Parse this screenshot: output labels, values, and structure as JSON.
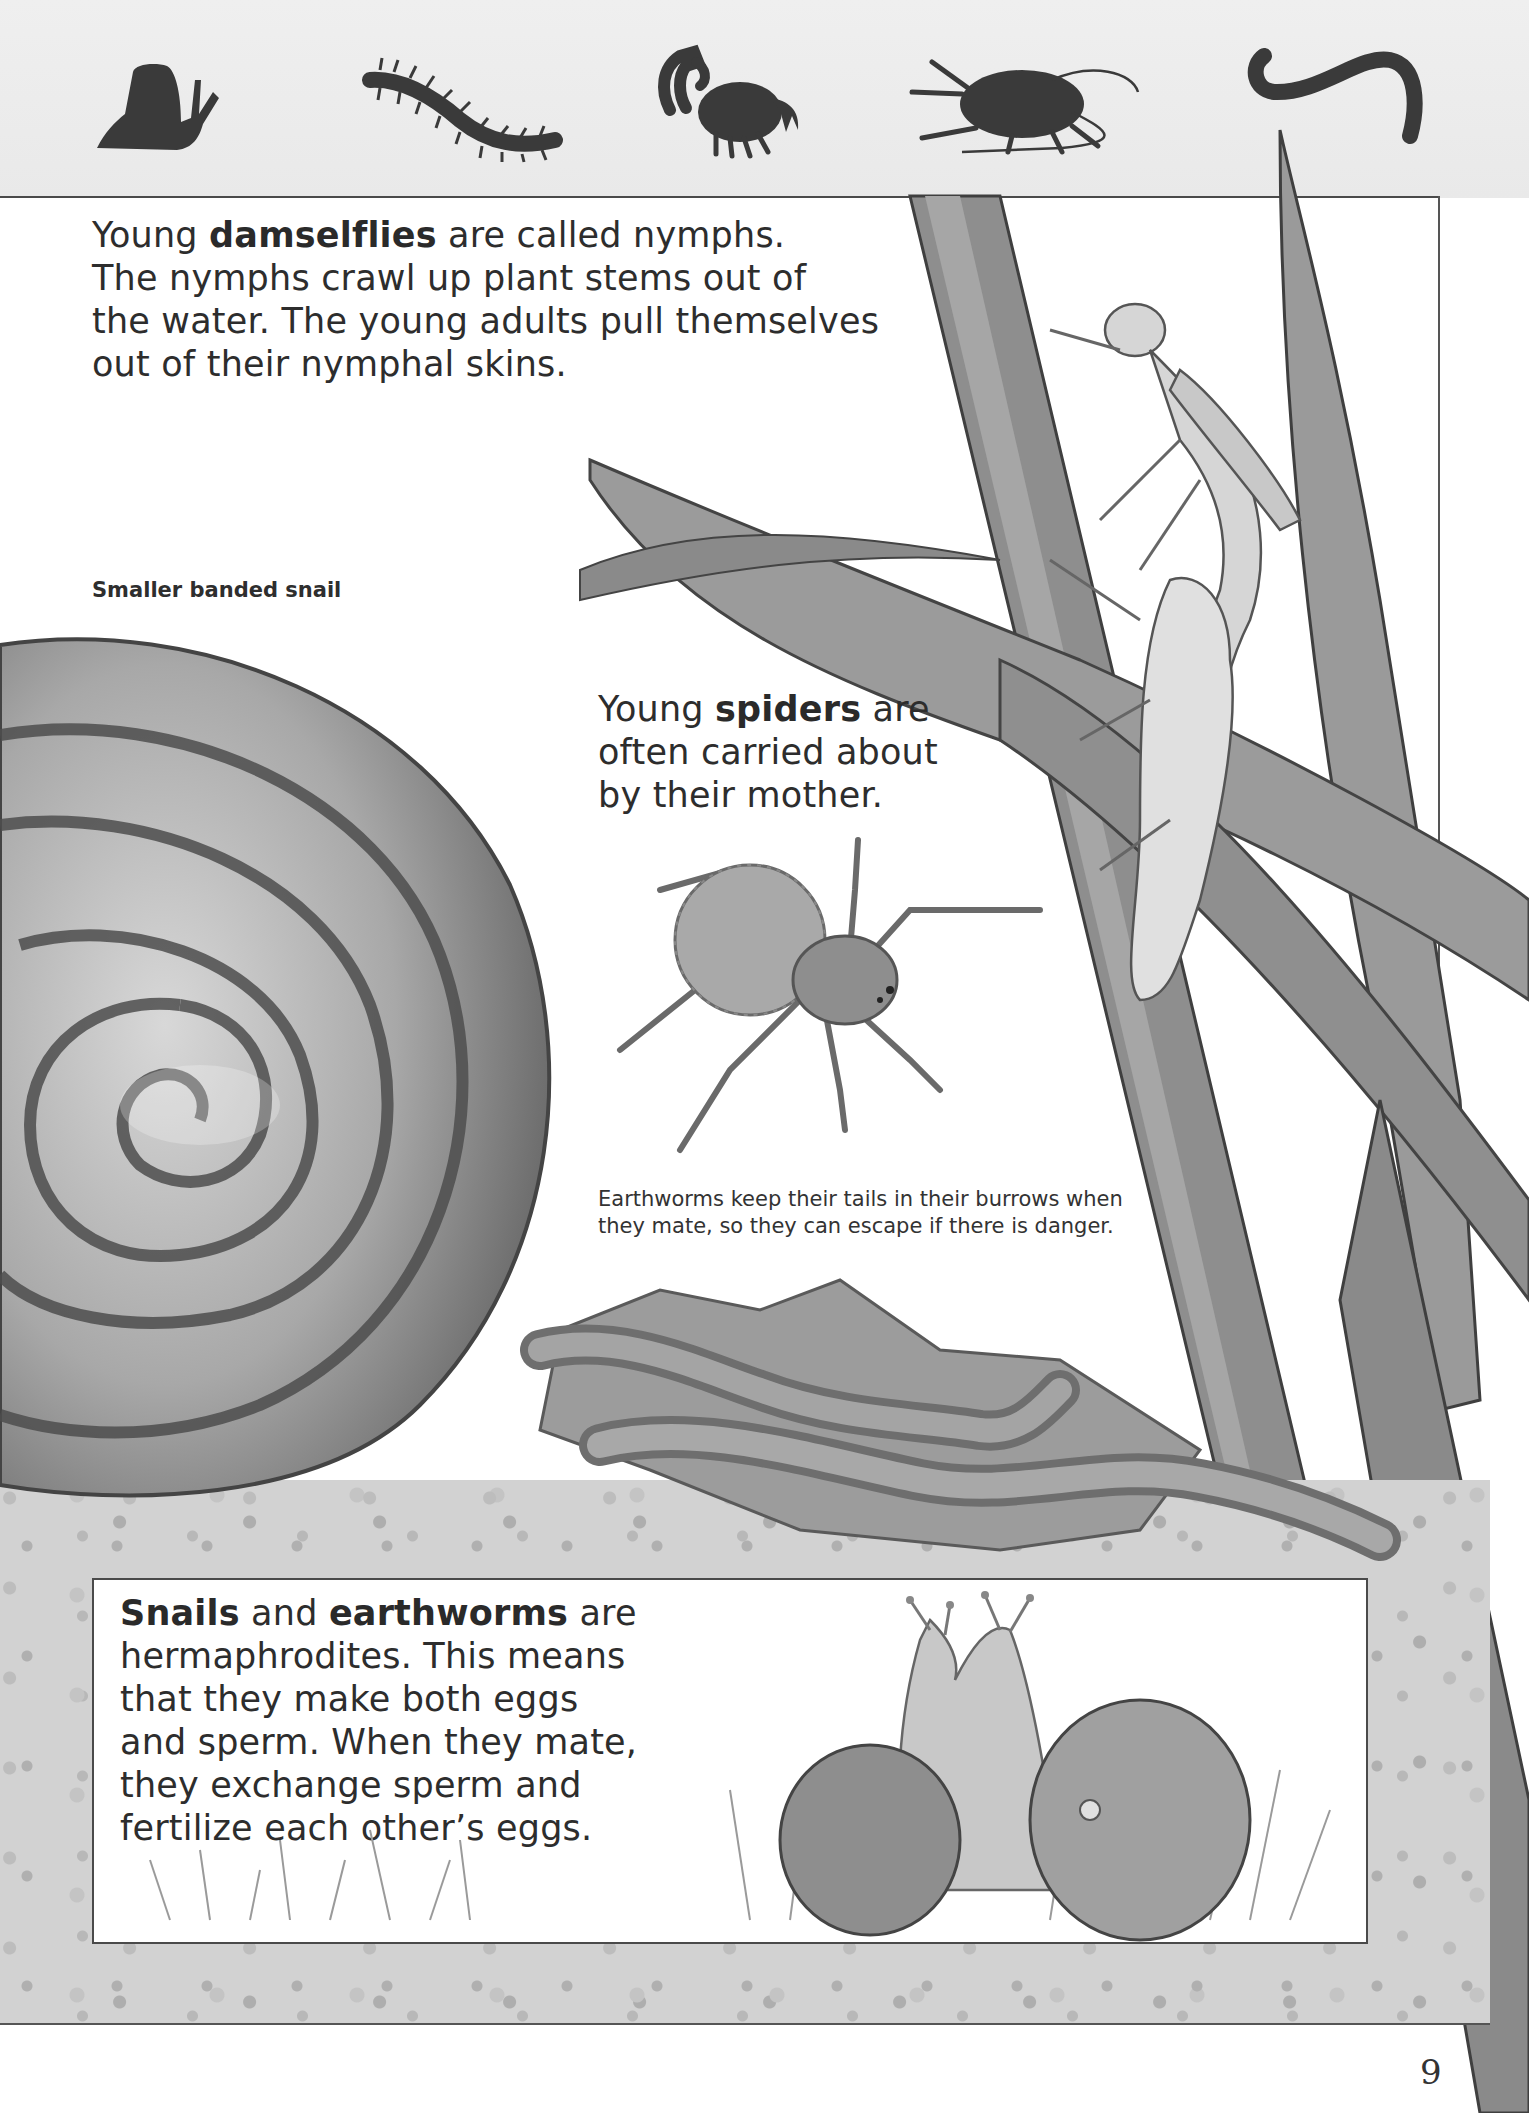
{
  "header": {
    "silhouettes": [
      {
        "name": "snail-icon",
        "label": "snail silhouette"
      },
      {
        "name": "centipede-icon",
        "label": "centipede silhouette"
      },
      {
        "name": "scorpion-icon",
        "label": "scorpion silhouette"
      },
      {
        "name": "cockroach-icon",
        "label": "cockroach silhouette"
      },
      {
        "name": "worm-icon",
        "label": "worm silhouette"
      }
    ],
    "silhouette_color": "#3a3a3a",
    "band_color": "#ececec"
  },
  "damselfly_section": {
    "line1_pre": "Young ",
    "line1_bold": "damselflies",
    "line1_post": " are called nymphs.",
    "line2": "The nymphs crawl up plant stems out of",
    "line3": "the water. The young adults pull themselves",
    "line4": "out of their nymphal skins."
  },
  "snail_label": "Smaller banded snail",
  "spider_section": {
    "line1_pre": "Young ",
    "line1_bold": "spiders",
    "line1_post": " are",
    "line2": "often carried about",
    "line3": "by their mother."
  },
  "earthworm_caption": {
    "line1": "Earthworms keep their tails in their burrows when",
    "line2": "they mate, so they can escape if there is danger."
  },
  "hermaphrodite_box": {
    "line1_bold_a": "Snails",
    "line1_mid": " and ",
    "line1_bold_b": "earthworms",
    "line1_post": " are",
    "line2": "hermaphrodites. This means",
    "line3": "that they make both eggs",
    "line4": "and sperm. When they mate,",
    "line5": "they exchange sperm and",
    "line6": "fertilize each other’s eggs."
  },
  "page_number": "9",
  "illustrations": [
    "banded-snail-shell",
    "damselfly-emerging-on-reeds",
    "wolf-spider-with-egg-sac",
    "mating-earthworms-on-leaves",
    "mating-snails-in-grass"
  ]
}
